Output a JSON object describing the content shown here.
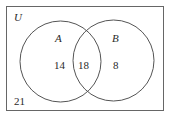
{
  "diagram": {
    "type": "venn",
    "universe_label": "U",
    "sets": [
      {
        "label": "A",
        "only_count": "14"
      },
      {
        "label": "B",
        "only_count": "8"
      }
    ],
    "intersection_count": "18",
    "outside_count": "21"
  },
  "colors": {
    "stroke": "#555555",
    "text": "#2a2a2a",
    "background": "#ffffff"
  }
}
